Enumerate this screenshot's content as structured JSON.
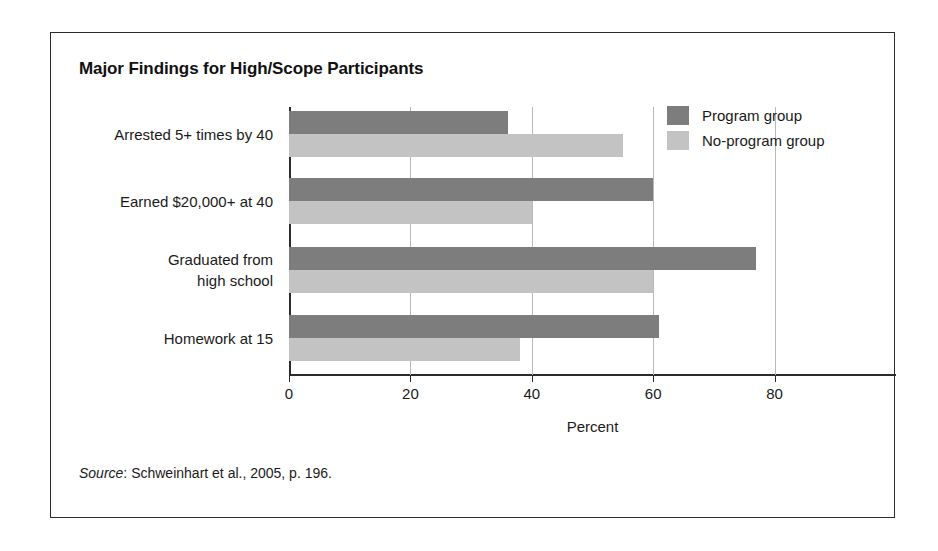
{
  "figure": {
    "title": "Major Findings for High/Scope Participants",
    "source_label": "Source",
    "source_rest": ": Schweinhart et al., 2005, p. 196."
  },
  "colors": {
    "program": "#7d7d7d",
    "no_program": "#c3c3c3",
    "frame": "#2b2b2b",
    "gridline": "#b9b9b9",
    "background": "#ffffff"
  },
  "legend": {
    "position": "top-right",
    "items": [
      {
        "label": "Program group",
        "color": "#7d7d7d",
        "swatch": "program-swatch"
      },
      {
        "label": "No-program group",
        "color": "#c3c3c3",
        "swatch": "no-program-swatch"
      }
    ]
  },
  "axis": {
    "ticks": [
      "0",
      "20",
      "40",
      "60",
      "80"
    ],
    "xlabel": "Percent"
  },
  "chart_data": {
    "type": "bar",
    "orientation": "horizontal",
    "title": "Major Findings for High/Scope Participants",
    "xlabel": "Percent",
    "ylabel": "",
    "xlim": [
      0,
      100
    ],
    "xticks": [
      0,
      20,
      40,
      60,
      80
    ],
    "grid": true,
    "legend_position": "top-right",
    "categories": [
      "Arrested 5+ times by 40",
      "Earned $20,000+ at 40",
      "Graduated from\nhigh school",
      "Homework at 15"
    ],
    "series": [
      {
        "name": "Program group",
        "color": "#7d7d7d",
        "values": [
          36,
          60,
          77,
          61
        ]
      },
      {
        "name": "No-program group",
        "color": "#c3c3c3",
        "values": [
          55,
          40,
          60,
          38
        ]
      }
    ],
    "annotations": [],
    "source": "Source: Schweinhart et al., 2005, p. 196."
  }
}
